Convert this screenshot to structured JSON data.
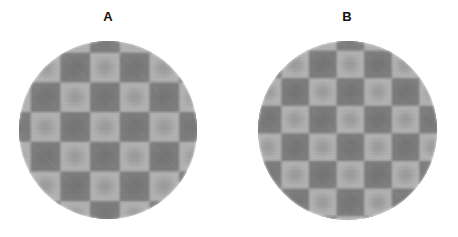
{
  "figure": {
    "background_color": "#ffffff",
    "width": 458,
    "height": 237,
    "panels": [
      {
        "id": "A",
        "label": "A",
        "disc": {
          "center_x": 108,
          "center_y": 130,
          "diameter": 178,
          "shape": "circle"
        },
        "pattern": {
          "type": "checkerboard",
          "cell_size_px": 29.7,
          "cells_across": 6,
          "phase_offset_x_px": 0,
          "phase_offset_y_px": 0,
          "light_color": "#b2b2b2",
          "dark_color": "#7c7c7c",
          "blob_style": "radial-gaussian-per-cell",
          "blob_dark_alpha": 0.2,
          "blob_light_alpha": 0.16,
          "blur_px": 1.1
        }
      },
      {
        "id": "B",
        "label": "B",
        "disc": {
          "center_x": 347,
          "center_y": 130,
          "diameter": 179,
          "shape": "circle"
        },
        "pattern": {
          "type": "checkerboard",
          "cell_size_px": 27.6,
          "cells_across": 6.5,
          "phase_offset_x_px": 13.8,
          "phase_offset_y_px": 0,
          "light_color": "#b2b2b2",
          "dark_color": "#7c7c7c",
          "blob_style": "radial-gaussian-per-cell",
          "blob_dark_alpha": 0.2,
          "blob_light_alpha": 0.16,
          "blur_px": 1.1
        }
      }
    ]
  }
}
